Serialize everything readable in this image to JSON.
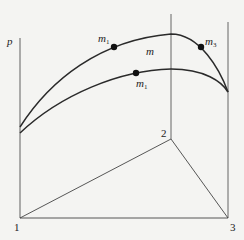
{
  "diagram": {
    "axis_label": "p",
    "points": {
      "vertex_1": "1",
      "vertex_2": "2",
      "vertex_3": "3"
    },
    "curve_labels": {
      "upper_left_point": {
        "base": "m",
        "sub": "1"
      },
      "upper_right_point": {
        "base": "m",
        "sub": "3"
      },
      "region": {
        "base": "m"
      },
      "lower_point": {
        "base": "m",
        "sub": "1"
      }
    },
    "colors": {
      "line": "#2a2a2a",
      "axis": "#7a7a7a",
      "background": "#f4f4f2",
      "marker": "#111111"
    }
  }
}
